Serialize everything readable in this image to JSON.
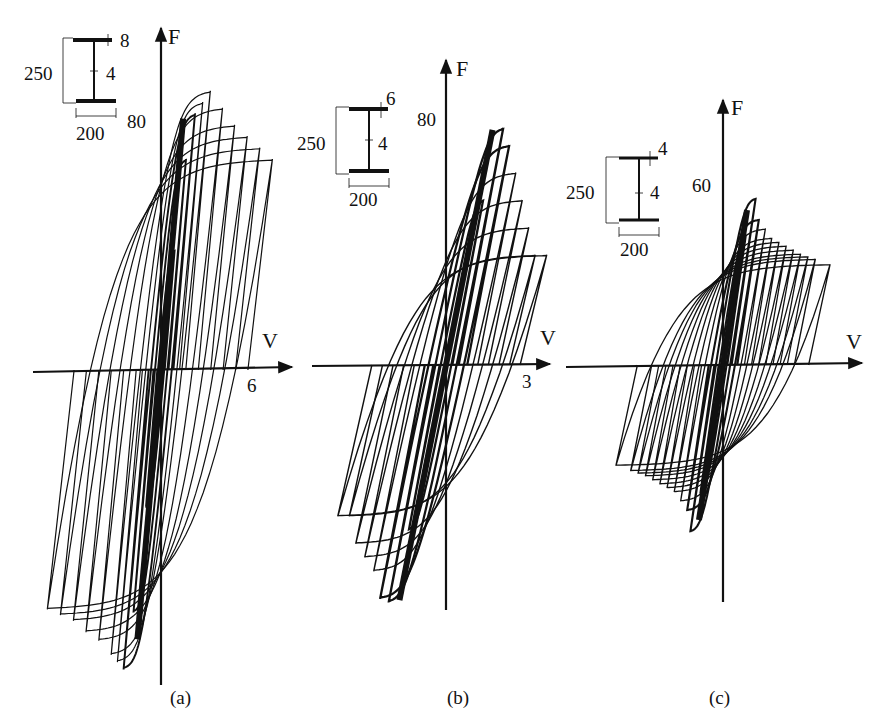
{
  "figure": {
    "ink_color": "#111111",
    "background": "#ffffff",
    "panels": [
      {
        "id": "a",
        "caption": "(a)",
        "y_axis_label": "F",
        "x_axis_label": "V",
        "y_tick_label": "80",
        "x_tick_label": "6",
        "section": {
          "height": "250",
          "width": "200",
          "flange_thickness": "8",
          "web_thickness": "4"
        }
      },
      {
        "id": "b",
        "caption": "(b)",
        "y_axis_label": "F",
        "x_axis_label": "V",
        "y_tick_label": "80",
        "x_tick_label": "3",
        "section": {
          "height": "250",
          "width": "200",
          "flange_thickness": "6",
          "web_thickness": "4"
        }
      },
      {
        "id": "c",
        "caption": "(c)",
        "y_axis_label": "F",
        "x_axis_label": "V",
        "y_tick_label": "60",
        "x_tick_label": "",
        "section": {
          "height": "250",
          "width": "200",
          "flange_thickness": "4",
          "web_thickness": "4"
        }
      }
    ]
  },
  "chart_data": [
    {
      "type": "line",
      "title": "(a) Hysteresis loops, section 250x200, flange 8, web 4",
      "xlabel": "V",
      "ylabel": "F",
      "x_tick_labels": [
        "6"
      ],
      "y_tick_labels": [
        "80"
      ],
      "grid": false,
      "legend": null,
      "description": "Cyclic force-displacement hysteresis; stable wide loops, peak F ~ 95-100, loops extend to V ~ +7 and V ~ -8, negative peak ~ -110",
      "envelope_positive": {
        "x": [
          0,
          0.5,
          1,
          2,
          3,
          4,
          5,
          6,
          7
        ],
        "y": [
          0,
          70,
          90,
          98,
          92,
          86,
          82,
          78,
          74
        ]
      },
      "envelope_negative": {
        "x": [
          0,
          -0.5,
          -1,
          -2,
          -3,
          -4,
          -5,
          -6,
          -7,
          -8
        ],
        "y": [
          0,
          -80,
          -105,
          -100,
          -95,
          -92,
          -88,
          -86,
          -84,
          -82
        ]
      },
      "cycle_amplitudes_v": [
        0.3,
        0.6,
        1,
        1.5,
        2,
        3,
        4,
        5,
        6,
        7
      ]
    },
    {
      "type": "line",
      "title": "(b) Hysteresis loops, section 250x200, flange 6, web 4",
      "xlabel": "V",
      "ylabel": "F",
      "x_tick_labels": [
        "3"
      ],
      "y_tick_labels": [
        "80"
      ],
      "grid": false,
      "legend": null,
      "description": "Cyclic force-displacement hysteresis; pinched loops with strength degradation after peak F ~ 95, V range ~ -3.5 to +3.5",
      "envelope_positive": {
        "x": [
          0,
          0.3,
          0.7,
          1,
          1.5,
          2,
          2.5,
          3
        ],
        "y": [
          0,
          60,
          95,
          80,
          70,
          60,
          50,
          40
        ]
      },
      "envelope_negative": {
        "x": [
          0,
          -0.3,
          -0.7,
          -1,
          -1.5,
          -2,
          -2.5,
          -3
        ],
        "y": [
          0,
          -60,
          -95,
          -85,
          -75,
          -70,
          -65,
          -55
        ]
      },
      "cycle_amplitudes_v": [
        0.3,
        0.6,
        1,
        1.5,
        2,
        2.5,
        3,
        3.5
      ]
    },
    {
      "type": "line",
      "title": "(c) Hysteresis loops, section 250x200, flange 4, web 4",
      "xlabel": "V",
      "ylabel": "F",
      "x_tick_labels": [],
      "y_tick_labels": [
        "60"
      ],
      "grid": false,
      "legend": null,
      "description": "Cyclic force-displacement hysteresis; sharp peak F ~ 65 then stepwise degradation to ~ 40, V range ~ -6 to +6",
      "envelope_positive": {
        "x": [
          0,
          0.2,
          0.5,
          1,
          2,
          3,
          4,
          5,
          6
        ],
        "y": [
          0,
          40,
          65,
          55,
          48,
          45,
          42,
          40,
          38
        ]
      },
      "envelope_negative": {
        "x": [
          0,
          -0.2,
          -0.5,
          -1,
          -2,
          -3,
          -4,
          -5,
          -6
        ],
        "y": [
          0,
          -40,
          -65,
          -55,
          -48,
          -45,
          -42,
          -40,
          -38
        ]
      },
      "cycle_amplitudes_v": [
        0.3,
        0.6,
        1,
        1.5,
        2,
        2.5,
        3,
        3.5,
        4,
        4.5,
        5,
        6
      ]
    }
  ]
}
